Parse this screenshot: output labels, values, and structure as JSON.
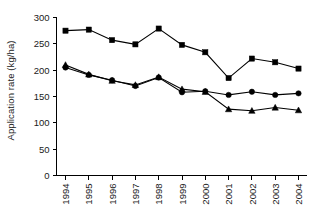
{
  "chart_data": {
    "type": "line",
    "title": "",
    "subtitle": "",
    "xlabel": "",
    "ylabel": "Application rate (kg/ha)",
    "x": [
      1994,
      1995,
      1996,
      1997,
      1998,
      1999,
      2000,
      2001,
      2002,
      2003,
      2004
    ],
    "categories": [
      "1994",
      "1995",
      "1996",
      "1997",
      "1998",
      "1999",
      "2000",
      "2001",
      "2002",
      "2003",
      "2004"
    ],
    "xtick_labels": [
      "1994",
      "1995",
      "1996",
      "1997",
      "1998",
      "1999",
      "2000",
      "2001",
      "2002",
      "2003",
      "2004"
    ],
    "ytick_labels": [
      "0",
      "50",
      "100",
      "150",
      "200",
      "250",
      "300"
    ],
    "yticks": [
      0,
      50,
      100,
      150,
      200,
      250,
      300
    ],
    "ylim": [
      0,
      300
    ],
    "xlim": [
      1993.6,
      2004.5
    ],
    "grid": false,
    "legend": "none",
    "legend_position": "none",
    "annotations": [],
    "series": [
      {
        "name": "series-squares",
        "marker": "square",
        "color": "#000000",
        "values": [
          275,
          277,
          257,
          249,
          279,
          248,
          234,
          185,
          222,
          215,
          203
        ]
      },
      {
        "name": "series-circles",
        "marker": "circle",
        "color": "#000000",
        "values": [
          205,
          191,
          181,
          170,
          186,
          158,
          160,
          153,
          159,
          153,
          156
        ]
      },
      {
        "name": "series-triangles",
        "marker": "triangle",
        "color": "#000000",
        "values": [
          210,
          192,
          180,
          172,
          187,
          164,
          159,
          126,
          123,
          129,
          124
        ]
      }
    ]
  },
  "axis": {
    "y_title": "Application rate (kg/ha)"
  }
}
